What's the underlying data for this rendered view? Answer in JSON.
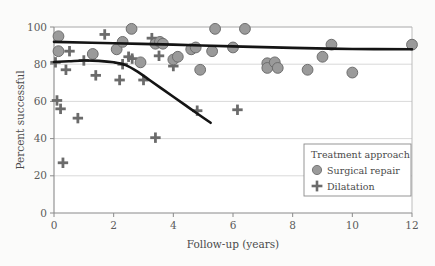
{
  "chart_data": {
    "type": "scatter",
    "title": "",
    "xlabel": "Follow-up (years)",
    "ylabel": "Percent successful",
    "xlim": [
      0,
      12
    ],
    "ylim": [
      0,
      100
    ],
    "xticks": [
      "0",
      "2",
      "4",
      "6",
      "8",
      "10",
      "12"
    ],
    "xtick_values": [
      0,
      2,
      4,
      6,
      8,
      10,
      12
    ],
    "yticks": [
      "0",
      "20",
      "40",
      "60",
      "80",
      "100"
    ],
    "ytick_values": [
      0,
      20,
      40,
      60,
      80,
      100
    ],
    "grid": "horizontal",
    "legend_position": "lower-right",
    "legend_title": "Treatment approach",
    "series": [
      {
        "name": "Surgical repair",
        "marker": "circle",
        "color": "#9a9a9a",
        "edge_color": "#6e6e6e",
        "points": [
          [
            0.15,
            95.0
          ],
          [
            0.15,
            87.0
          ],
          [
            1.3,
            85.5
          ],
          [
            2.1,
            88.0
          ],
          [
            2.3,
            92.0
          ],
          [
            2.6,
            99.0
          ],
          [
            2.9,
            81.0
          ],
          [
            3.4,
            91.0
          ],
          [
            3.55,
            92.0
          ],
          [
            3.65,
            91.0
          ],
          [
            4.0,
            82.5
          ],
          [
            4.15,
            84.0
          ],
          [
            4.6,
            88.0
          ],
          [
            4.75,
            89.0
          ],
          [
            4.9,
            77.0
          ],
          [
            5.3,
            87.0
          ],
          [
            5.4,
            99.0
          ],
          [
            6.0,
            89.0
          ],
          [
            6.4,
            99.0
          ],
          [
            7.15,
            80.5
          ],
          [
            7.15,
            78.0
          ],
          [
            7.4,
            81.0
          ],
          [
            7.5,
            78.0
          ],
          [
            8.5,
            77.0
          ],
          [
            9.0,
            84.0
          ],
          [
            9.3,
            90.5
          ],
          [
            10.0,
            75.5
          ],
          [
            12.0,
            90.5
          ]
        ]
      },
      {
        "name": "Dilatation",
        "marker": "plus",
        "color": "#6b6b6b",
        "points": [
          [
            0.05,
            81.0
          ],
          [
            0.1,
            60.5
          ],
          [
            0.22,
            56.0
          ],
          [
            0.3,
            27.0
          ],
          [
            0.4,
            77.0
          ],
          [
            0.52,
            87.0
          ],
          [
            0.8,
            51.0
          ],
          [
            1.0,
            82.0
          ],
          [
            1.4,
            74.0
          ],
          [
            1.7,
            96.0
          ],
          [
            2.2,
            71.5
          ],
          [
            2.3,
            80.0
          ],
          [
            2.5,
            84.0
          ],
          [
            2.62,
            83.0
          ],
          [
            3.0,
            71.5
          ],
          [
            3.28,
            94.0
          ],
          [
            3.4,
            40.5
          ],
          [
            3.52,
            84.5
          ],
          [
            4.0,
            79.0
          ],
          [
            4.8,
            55.0
          ],
          [
            6.15,
            55.5
          ]
        ]
      }
    ],
    "trend_lines": [
      {
        "name": "Surgical repair trend",
        "color": "#141414",
        "points": [
          [
            0.0,
            92.0
          ],
          [
            2.0,
            91.3
          ],
          [
            4.0,
            90.5
          ],
          [
            6.0,
            89.6
          ],
          [
            8.0,
            88.8
          ],
          [
            10.0,
            88.2
          ],
          [
            12.0,
            88.0
          ]
        ]
      },
      {
        "name": "Dilatation trend",
        "color": "#141414",
        "points": [
          [
            0.0,
            81.2
          ],
          [
            0.5,
            81.6
          ],
          [
            1.0,
            82.0
          ],
          [
            1.5,
            81.8
          ],
          [
            2.0,
            81.0
          ],
          [
            2.4,
            79.5
          ],
          [
            2.8,
            76.0
          ],
          [
            3.2,
            71.5
          ],
          [
            3.6,
            67.0
          ],
          [
            4.0,
            62.5
          ],
          [
            4.4,
            58.0
          ],
          [
            4.8,
            53.5
          ],
          [
            5.25,
            48.5
          ]
        ]
      }
    ],
    "legend_entries": [
      {
        "label": "Surgical repair",
        "marker": "circle"
      },
      {
        "label": "Dilatation",
        "marker": "plus"
      }
    ]
  }
}
